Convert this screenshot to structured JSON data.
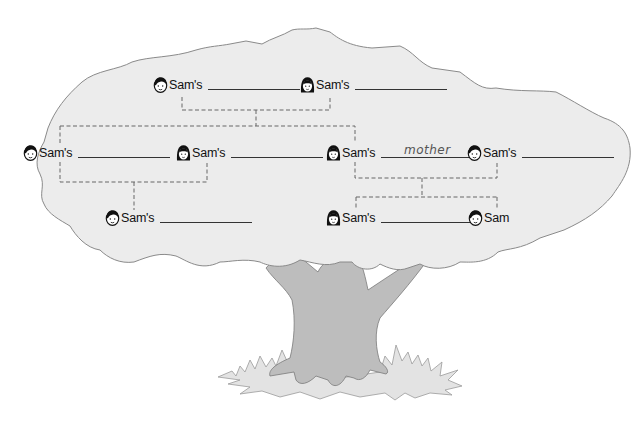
{
  "diagram": {
    "type": "family-tree",
    "colors": {
      "canopy_fill": "#ececec",
      "canopy_stroke": "#8a8a8a",
      "trunk_fill": "#bdbdbd",
      "grass_fill": "#e6e6e6",
      "connector": "#666666",
      "text": "#111111"
    },
    "generations": {
      "grandparents": [
        {
          "id": "grandfather",
          "gender": "male",
          "icon": "boy-face-icon",
          "label": "Sam's",
          "answer": ""
        },
        {
          "id": "grandmother",
          "gender": "female",
          "icon": "girl-face-icon",
          "label": "Sam's",
          "answer": ""
        }
      ],
      "parents": [
        {
          "id": "uncle",
          "gender": "male",
          "icon": "boy-face-icon",
          "label": "Sam's",
          "answer": ""
        },
        {
          "id": "aunt",
          "gender": "female",
          "icon": "girl-face-icon",
          "label": "Sam's",
          "answer": ""
        },
        {
          "id": "mother",
          "gender": "female",
          "icon": "girl-face-icon",
          "label": "Sam's",
          "answer": "mother"
        },
        {
          "id": "father",
          "gender": "male",
          "icon": "boy-face-icon",
          "label": "Sam's",
          "answer": ""
        }
      ],
      "children": [
        {
          "id": "cousin",
          "gender": "male",
          "icon": "boy-face-icon",
          "label": "Sam's",
          "answer": ""
        },
        {
          "id": "sister",
          "gender": "female",
          "icon": "girl-face-icon",
          "label": "Sam's",
          "answer": ""
        },
        {
          "id": "self",
          "gender": "male",
          "icon": "boy-face-icon",
          "label": "Sam",
          "answer": null
        }
      ]
    }
  }
}
